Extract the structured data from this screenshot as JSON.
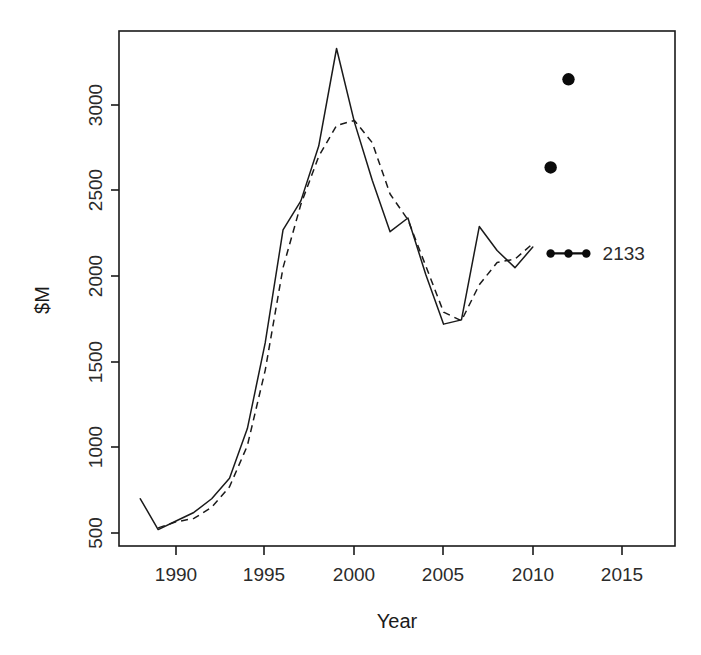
{
  "chart_data": {
    "type": "line",
    "title": "",
    "xlabel": "Year",
    "ylabel": "$M",
    "xlim": [
      1987.6,
      2016.0
    ],
    "ylim": [
      455,
      3400
    ],
    "grid": false,
    "legend": null,
    "xticks": [
      1990,
      1995,
      2000,
      2005,
      2010,
      2015
    ],
    "xtick_labels": [
      "1990",
      "1995",
      "2000",
      "2005",
      "2010",
      "2015"
    ],
    "yticks": [
      500,
      1000,
      1500,
      2000,
      2500,
      3000
    ],
    "ytick_labels": [
      "500",
      "1000",
      "1500",
      "2000",
      "2500",
      "3000"
    ],
    "series": [
      {
        "name": "actual",
        "style": "solid",
        "x": [
          1988,
          1989,
          1990,
          1991,
          1992,
          1993,
          1994,
          1995,
          1996,
          1997,
          1998,
          1999,
          2000,
          2001,
          2002,
          2003,
          2004,
          2005,
          2006,
          2007,
          2008,
          2009,
          2010
        ],
        "values": [
          700,
          520,
          570,
          620,
          700,
          820,
          1110,
          1610,
          2270,
          2440,
          2760,
          3330,
          2900,
          2560,
          2260,
          2340,
          2010,
          1720,
          1745,
          2290,
          2150,
          2050,
          2170
        ]
      },
      {
        "name": "fitted",
        "style": "dashed",
        "x": [
          1989,
          1990,
          1991,
          1992,
          1993,
          1994,
          1995,
          1996,
          1997,
          1998,
          1999,
          2000,
          2001,
          2002,
          2003,
          2004,
          2005,
          2006,
          2007,
          2008,
          2009,
          2010
        ],
        "values": [
          530,
          565,
          585,
          650,
          770,
          1010,
          1450,
          2050,
          2420,
          2700,
          2880,
          2910,
          2780,
          2480,
          2330,
          2060,
          1790,
          1740,
          1950,
          2080,
          2100,
          2190
        ]
      }
    ],
    "points": [
      {
        "x": 2012,
        "y": 3150,
        "marker": "filled-circle",
        "size": "large"
      },
      {
        "x": 2011,
        "y": 2635,
        "marker": "filled-circle",
        "size": "large"
      }
    ],
    "forecast": {
      "x": [
        2011,
        2012,
        2013
      ],
      "values": [
        2133,
        2133,
        2133
      ],
      "marker": "filled-circle",
      "label": "2133"
    },
    "annotations": [
      {
        "text": "2133",
        "x": 2013.8,
        "y": 2133
      }
    ]
  },
  "labels": {
    "y_axis_title": "$M",
    "x_axis_title": "Year",
    "annotation_2133": "2133",
    "ytick_3000": "3000",
    "ytick_2500": "2500",
    "ytick_2000": "2000",
    "ytick_1500": "1500",
    "ytick_1000": "1000",
    "ytick_500": "500",
    "xtick_1990": "1990",
    "xtick_1995": "1995",
    "xtick_2000": "2000",
    "xtick_2005": "2005",
    "xtick_2010": "2010",
    "xtick_2015": "2015"
  },
  "colors": {
    "background": "#ffffff",
    "ink": "#1a1a1a",
    "marker": "#0b0b0b"
  }
}
